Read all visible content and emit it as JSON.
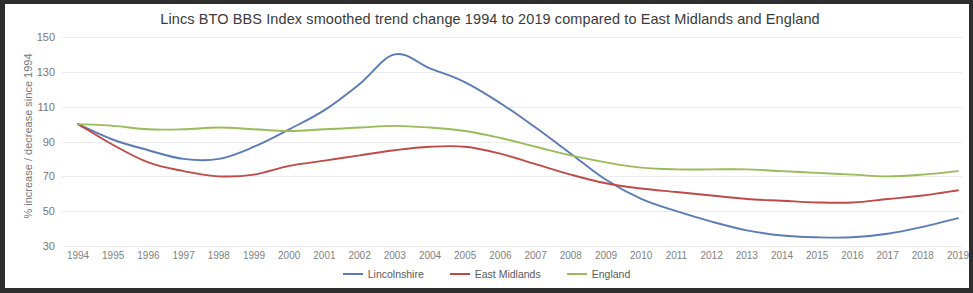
{
  "chart_data": {
    "type": "line",
    "title": "Lincs BTO BBS Index smoothed trend change 1994 to 2019 compared to East Midlands and England",
    "xlabel": "",
    "ylabel": "% increase / decrease since 1994",
    "ylim": [
      30,
      150
    ],
    "yticks": [
      150,
      130,
      110,
      90,
      70,
      50,
      30
    ],
    "grid": true,
    "legend_position": "bottom",
    "categories": [
      "1994",
      "1995",
      "1996",
      "1997",
      "1998",
      "1999",
      "2000",
      "2001",
      "2002",
      "2003",
      "2004",
      "2005",
      "2006",
      "2007",
      "2008",
      "2009",
      "2010",
      "2011",
      "2012",
      "2013",
      "2014",
      "2015",
      "2016",
      "2017",
      "2018",
      "2019"
    ],
    "series": [
      {
        "name": "Lincolnshire",
        "color": "#5b7bb5",
        "values": [
          100,
          91,
          85,
          80,
          80,
          87,
          97,
          108,
          123,
          140,
          132,
          124,
          112,
          98,
          83,
          68,
          57,
          50,
          44,
          39,
          36,
          35,
          35,
          37,
          41,
          46
        ]
      },
      {
        "name": "East Midlands",
        "color": "#be4b48",
        "values": [
          100,
          88,
          78,
          73,
          70,
          71,
          76,
          79,
          82,
          85,
          87,
          87,
          83,
          77,
          71,
          66,
          63,
          61,
          59,
          57,
          56,
          55,
          55,
          57,
          59,
          62
        ]
      },
      {
        "name": "England",
        "color": "#9bbb59",
        "values": [
          100,
          99,
          97,
          97,
          98,
          97,
          96,
          97,
          98,
          99,
          98,
          96,
          92,
          87,
          82,
          78,
          75,
          74,
          74,
          74,
          73,
          72,
          71,
          70,
          71,
          73
        ]
      }
    ]
  }
}
